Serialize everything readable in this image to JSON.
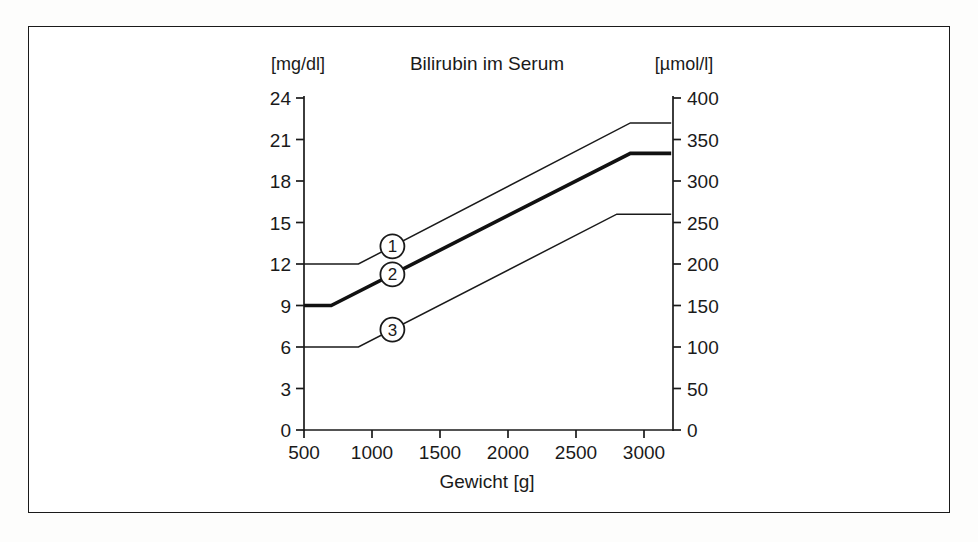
{
  "figure": {
    "title": "Bilirubin im Serum",
    "left_unit": "[mg/dl]",
    "right_unit": "[µmol/l]",
    "xlabel": "Gewicht [g]"
  },
  "markers": [
    {
      "id": "1",
      "label": "1"
    },
    {
      "id": "2",
      "label": "2"
    },
    {
      "id": "3",
      "label": "3"
    }
  ],
  "chart_data": {
    "type": "line",
    "title": "Bilirubin im Serum",
    "xlabel": "Gewicht [g]",
    "ylabel": "[mg/dl]",
    "y2label": "[µmol/l]",
    "xlim": [
      500,
      3200
    ],
    "ylim": [
      0,
      24
    ],
    "y2lim": [
      0,
      400
    ],
    "grid": false,
    "legend": "inline-numbered-markers",
    "xticks": [
      500,
      1000,
      1500,
      2000,
      2500,
      3000
    ],
    "yticks": [
      0,
      3,
      6,
      9,
      12,
      15,
      18,
      21,
      24
    ],
    "y2ticks": [
      0,
      50,
      100,
      150,
      200,
      250,
      300,
      350,
      400
    ],
    "x_unit": "g",
    "y_unit": "mg/dl",
    "y2_unit": "µmol/l",
    "conversion_factor_mgdl_to_umoll": 17.1,
    "series": [
      {
        "name": "1",
        "marker_label": "1",
        "style": "thin",
        "x": [
          500,
          900,
          2900,
          3200
        ],
        "y_mgdl": [
          12,
          12,
          22.2,
          22.2
        ],
        "y_umoll": [
          205,
          205,
          380,
          380
        ],
        "marker_at_x": 1150
      },
      {
        "name": "2",
        "marker_label": "2",
        "style": "bold",
        "x": [
          500,
          700,
          2900,
          3200
        ],
        "y_mgdl": [
          9,
          9,
          20,
          20
        ],
        "y_umoll": [
          154,
          154,
          342,
          342
        ],
        "marker_at_x": 1150
      },
      {
        "name": "3",
        "marker_label": "3",
        "style": "thin",
        "x": [
          500,
          900,
          2800,
          3200
        ],
        "y_mgdl": [
          6,
          6,
          15.6,
          15.6
        ],
        "y_umoll": [
          103,
          103,
          267,
          267
        ],
        "marker_at_x": 1150
      }
    ]
  }
}
